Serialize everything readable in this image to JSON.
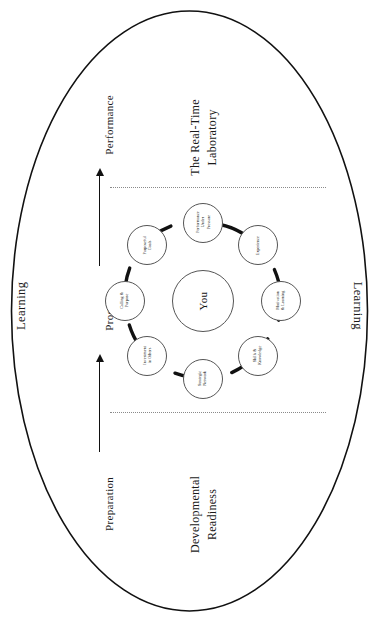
{
  "diagram": {
    "outer_label_left": "Learning",
    "outer_label_right": "Learning",
    "phases": [
      {
        "id": "performance",
        "label": "Performance"
      },
      {
        "id": "process",
        "label": "Process"
      },
      {
        "id": "preparation",
        "label": "Preparation"
      }
    ],
    "zones": [
      {
        "id": "real-time-laboratory",
        "label": "The Real-Time\nLaboratory"
      },
      {
        "id": "developmental-readiness",
        "label": "Developmental\nReadiness"
      }
    ],
    "zone_realtime_line1": "The Real-Time",
    "zone_realtime_line2": "Laboratory",
    "zone_readiness_line1": "Developmental",
    "zone_readiness_line2": "Readiness",
    "core": {
      "id": "you",
      "label": "You"
    },
    "nodes": [
      {
        "id": "performance-under-pressure",
        "line1": "Performance",
        "line2": "Under",
        "line3": "Pressure"
      },
      {
        "id": "experience",
        "line1": "Experience",
        "line2": "",
        "line3": ""
      },
      {
        "id": "motivation-and-learning",
        "line1": "Motivation",
        "line2": "& Learning",
        "line3": ""
      },
      {
        "id": "skills-and-knowledge",
        "line1": "Skills &",
        "line2": "Knowledge",
        "line3": ""
      },
      {
        "id": "strategic-network",
        "line1": "Strategic",
        "line2": "Network",
        "line3": ""
      },
      {
        "id": "investment-in-others",
        "line1": "Investment",
        "line2": "in Others",
        "line3": ""
      },
      {
        "id": "calling-and-purpose",
        "line1": "Calling &",
        "line2": "Purpose",
        "line3": ""
      },
      {
        "id": "purposeful-goals",
        "line1": "Purposeful",
        "line2": "Goals",
        "line3": ""
      }
    ],
    "colors": {
      "outline": "#111111",
      "node_stroke": "#555555",
      "connector": "#111111",
      "divider": "#8a8a8a",
      "background": "#ffffff"
    }
  }
}
